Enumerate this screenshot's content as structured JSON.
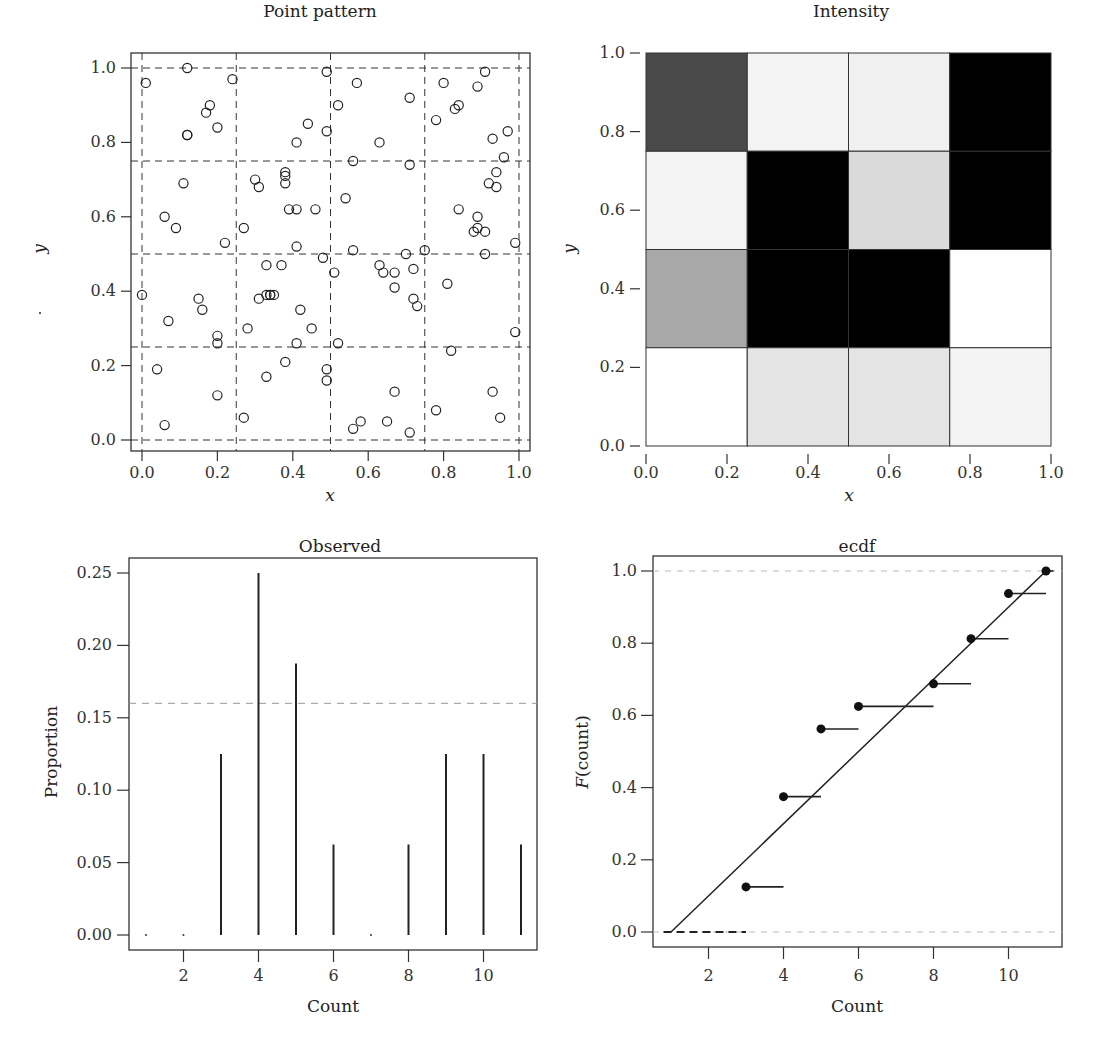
{
  "chart_data": [
    {
      "id": "point-pattern",
      "type": "scatter",
      "title": "Point pattern",
      "xlabel": "x",
      "ylabel": "y",
      "xlim": [
        0,
        1
      ],
      "ylim": [
        0,
        1
      ],
      "xticks": [
        "0.0",
        "0.2",
        "0.4",
        "0.6",
        "0.8",
        "1.0"
      ],
      "yticks": [
        "0.0",
        "0.2",
        "0.4",
        "0.6",
        "0.8",
        "1.0"
      ],
      "grid_lines": [
        0,
        0.25,
        0.5,
        0.75,
        1.0
      ],
      "grid_style": "dashed",
      "marker": "open-circle",
      "points": [
        [
          0.01,
          0.96
        ],
        [
          0.12,
          1.0
        ],
        [
          0.24,
          0.97
        ],
        [
          0.18,
          0.9
        ],
        [
          0.17,
          0.88
        ],
        [
          0.2,
          0.84
        ],
        [
          0.12,
          0.82
        ],
        [
          0.12,
          0.82
        ],
        [
          0.49,
          0.99
        ],
        [
          0.57,
          0.96
        ],
        [
          0.52,
          0.9
        ],
        [
          0.44,
          0.85
        ],
        [
          0.41,
          0.8
        ],
        [
          0.49,
          0.83
        ],
        [
          0.71,
          0.92
        ],
        [
          0.63,
          0.8
        ],
        [
          0.8,
          0.96
        ],
        [
          0.84,
          0.9
        ],
        [
          0.83,
          0.89
        ],
        [
          0.78,
          0.86
        ],
        [
          0.89,
          0.95
        ],
        [
          0.91,
          0.99
        ],
        [
          0.93,
          0.81
        ],
        [
          0.97,
          0.83
        ],
        [
          0.96,
          0.76
        ],
        [
          0.11,
          0.69
        ],
        [
          0.06,
          0.6
        ],
        [
          0.09,
          0.57
        ],
        [
          0.22,
          0.53
        ],
        [
          0.3,
          0.7
        ],
        [
          0.31,
          0.68
        ],
        [
          0.38,
          0.71
        ],
        [
          0.38,
          0.72
        ],
        [
          0.38,
          0.69
        ],
        [
          0.39,
          0.62
        ],
        [
          0.41,
          0.62
        ],
        [
          0.46,
          0.62
        ],
        [
          0.27,
          0.57
        ],
        [
          0.41,
          0.52
        ],
        [
          0.56,
          0.75
        ],
        [
          0.54,
          0.65
        ],
        [
          0.71,
          0.74
        ],
        [
          0.56,
          0.51
        ],
        [
          0.84,
          0.62
        ],
        [
          0.89,
          0.6
        ],
        [
          0.88,
          0.56
        ],
        [
          0.89,
          0.57
        ],
        [
          0.91,
          0.56
        ],
        [
          0.94,
          0.72
        ],
        [
          0.92,
          0.69
        ],
        [
          0.94,
          0.68
        ],
        [
          0.99,
          0.53
        ],
        [
          0.91,
          0.5
        ],
        [
          0.0,
          0.39
        ],
        [
          0.15,
          0.38
        ],
        [
          0.16,
          0.35
        ],
        [
          0.07,
          0.32
        ],
        [
          0.2,
          0.28
        ],
        [
          0.2,
          0.26
        ],
        [
          0.33,
          0.47
        ],
        [
          0.37,
          0.47
        ],
        [
          0.31,
          0.38
        ],
        [
          0.33,
          0.39
        ],
        [
          0.34,
          0.39
        ],
        [
          0.34,
          0.39
        ],
        [
          0.35,
          0.39
        ],
        [
          0.42,
          0.35
        ],
        [
          0.28,
          0.3
        ],
        [
          0.45,
          0.3
        ],
        [
          0.41,
          0.26
        ],
        [
          0.48,
          0.49
        ],
        [
          0.51,
          0.45
        ],
        [
          0.63,
          0.47
        ],
        [
          0.64,
          0.45
        ],
        [
          0.67,
          0.45
        ],
        [
          0.67,
          0.41
        ],
        [
          0.7,
          0.5
        ],
        [
          0.72,
          0.46
        ],
        [
          0.72,
          0.38
        ],
        [
          0.73,
          0.36
        ],
        [
          0.75,
          0.51
        ],
        [
          0.81,
          0.42
        ],
        [
          0.82,
          0.24
        ],
        [
          0.99,
          0.29
        ],
        [
          0.04,
          0.19
        ],
        [
          0.06,
          0.04
        ],
        [
          0.2,
          0.12
        ],
        [
          0.27,
          0.06
        ],
        [
          0.33,
          0.17
        ],
        [
          0.38,
          0.21
        ],
        [
          0.49,
          0.19
        ],
        [
          0.49,
          0.16
        ],
        [
          0.52,
          0.26
        ],
        [
          0.56,
          0.03
        ],
        [
          0.58,
          0.05
        ],
        [
          0.65,
          0.05
        ],
        [
          0.67,
          0.13
        ],
        [
          0.71,
          0.02
        ],
        [
          0.78,
          0.08
        ],
        [
          0.93,
          0.13
        ],
        [
          0.95,
          0.06
        ]
      ]
    },
    {
      "id": "intensity",
      "type": "heatmap",
      "title": "Intensity",
      "xlabel": "x",
      "ylabel": "y",
      "xlim": [
        0,
        1
      ],
      "ylim": [
        0,
        1
      ],
      "xticks": [
        "0.0",
        "0.2",
        "0.4",
        "0.6",
        "0.8",
        "1.0"
      ],
      "yticks": [
        "0.0",
        "0.2",
        "0.4",
        "0.6",
        "0.8",
        "1.0"
      ],
      "cells_rows_top_to_bottom": [
        {
          "y": [
            0.75,
            1.0
          ],
          "fills": [
            "#4a4a4a",
            "#f3f3f3",
            "#f0f0f0",
            "#000000"
          ],
          "counts": [
            9,
            4,
            4,
            10
          ]
        },
        {
          "y": [
            0.5,
            0.75
          ],
          "fills": [
            "#f3f3f3",
            "#000000",
            "#dadada",
            "#000000"
          ],
          "counts": [
            4,
            10,
            5,
            11
          ]
        },
        {
          "y": [
            0.25,
            0.5
          ],
          "fills": [
            "#a8a8a8",
            "#000000",
            "#000000",
            "#ffffff"
          ],
          "counts": [
            6,
            10,
            9,
            3
          ]
        },
        {
          "y": [
            0.0,
            0.25
          ],
          "fills": [
            "#ffffff",
            "#e4e4e4",
            "#e4e4e4",
            "#f4f4f4"
          ],
          "counts": [
            3,
            5,
            5,
            4
          ]
        }
      ]
    },
    {
      "id": "observed",
      "type": "bar",
      "title": "Observed",
      "xlabel": "Count",
      "ylabel": "Proportion",
      "xlim": [
        0.6,
        11.3
      ],
      "ylim": [
        -0.01,
        0.26
      ],
      "xticks": [
        "2",
        "4",
        "6",
        "8",
        "10"
      ],
      "xtick_values": [
        2,
        4,
        6,
        8,
        10
      ],
      "yticks": [
        "0.00",
        "0.05",
        "0.10",
        "0.15",
        "0.20",
        "0.25"
      ],
      "ytick_values": [
        0,
        0.05,
        0.1,
        0.15,
        0.2,
        0.25
      ],
      "categories": [
        1,
        2,
        3,
        4,
        5,
        6,
        7,
        8,
        9,
        10,
        11
      ],
      "values": [
        0,
        0,
        0.125,
        0.25,
        0.1875,
        0.0625,
        0,
        0.0625,
        0.125,
        0.125,
        0.0625
      ],
      "reference_line": {
        "y": 0.16,
        "style": "dashed",
        "color": "#999999"
      }
    },
    {
      "id": "ecdf",
      "type": "line",
      "title": "ecdf",
      "xlabel": "Count",
      "ylabel_prefix": "F",
      "ylabel_suffix": "(count)",
      "xlim": [
        0.6,
        11.4
      ],
      "ylim": [
        -0.05,
        1.04
      ],
      "xticks": [
        "2",
        "4",
        "6",
        "8",
        "10"
      ],
      "xtick_values": [
        2,
        4,
        6,
        8,
        10
      ],
      "yticks": [
        "0.0",
        "0.2",
        "0.4",
        "0.6",
        "0.8",
        "1.0"
      ],
      "ytick_values": [
        0,
        0.2,
        0.4,
        0.6,
        0.8,
        1.0
      ],
      "steps": [
        {
          "x": 3,
          "x_end": 4,
          "y": 0.125
        },
        {
          "x": 4,
          "x_end": 5,
          "y": 0.375
        },
        {
          "x": 5,
          "x_end": 6,
          "y": 0.5625
        },
        {
          "x": 6,
          "x_end": 8,
          "y": 0.625
        },
        {
          "x": 8,
          "x_end": 9,
          "y": 0.6875
        },
        {
          "x": 9,
          "x_end": 10,
          "y": 0.8125
        },
        {
          "x": 10,
          "x_end": 11,
          "y": 0.9375
        },
        {
          "x": 11,
          "x_end": 11.2,
          "y": 1.0
        }
      ],
      "zero_segment": {
        "x_start": 0.8,
        "x_end": 3,
        "y": 0
      },
      "reference_line": {
        "x": [
          1,
          11
        ],
        "y": [
          0,
          1
        ],
        "label": "uniform cdf"
      },
      "horizontal_guides": [
        0,
        1
      ]
    }
  ]
}
